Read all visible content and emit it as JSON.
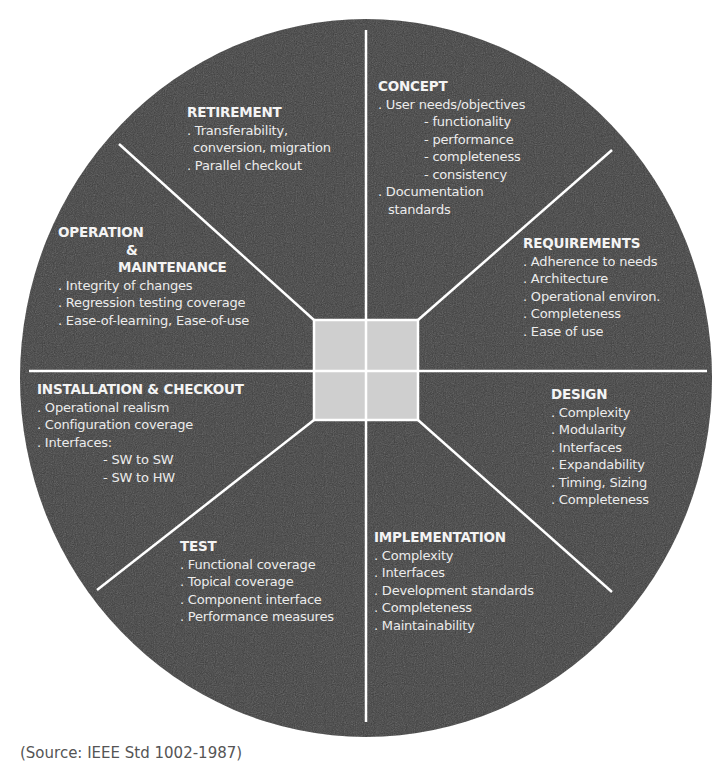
{
  "diagram": {
    "type": "life-cycle-wheel",
    "colors": {
      "wheel_fill": "#3c3c3c",
      "center_fill": "#cfcfcf",
      "divider": "#ffffff",
      "text": "#ececec",
      "background": "#ffffff"
    },
    "sectors": {
      "concept": {
        "title": "CONCEPT",
        "items": [
          ". User needs/objectives",
          "- functionality",
          "- performance",
          "- completeness",
          "- consistency",
          ". Documentation",
          "standards"
        ]
      },
      "requirements": {
        "title": "REQUIREMENTS",
        "items": [
          ". Adherence to needs",
          ". Architecture",
          ". Operational environ.",
          ". Completeness",
          ". Ease of use"
        ]
      },
      "design": {
        "title": "DESIGN",
        "items": [
          ". Complexity",
          ". Modularity",
          ". Interfaces",
          ". Expandability",
          ". Timing, Sizing",
          ". Completeness"
        ]
      },
      "implementation": {
        "title": "IMPLEMENTATION",
        "items": [
          ". Complexity",
          ". Interfaces",
          ". Development standards",
          ". Completeness",
          ". Maintainability"
        ]
      },
      "test": {
        "title": "TEST",
        "items": [
          ". Functional coverage",
          ". Topical coverage",
          ". Component interface",
          ". Performance measures"
        ]
      },
      "installation": {
        "title": "INSTALLATION & CHECKOUT",
        "items": [
          ". Operational realism",
          ". Configuration coverage",
          ". Interfaces:",
          "- SW to SW",
          "- SW to HW"
        ]
      },
      "operation": {
        "title_line1": "OPERATION",
        "title_line2": "&",
        "title_line3": "MAINTENANCE",
        "items": [
          ". Integrity of changes",
          ". Regression testing coverage",
          ". Ease-of-learning, Ease-of-use"
        ]
      },
      "retirement": {
        "title": "RETIREMENT",
        "items": [
          ". Transferability,",
          "conversion, migration",
          ". Parallel checkout"
        ]
      }
    }
  },
  "caption": {
    "text": "(Source: IEEE Std 1002-1987)"
  }
}
